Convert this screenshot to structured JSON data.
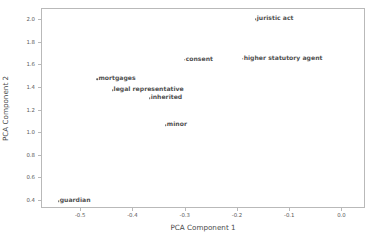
{
  "chart_data": {
    "type": "scatter",
    "title": "",
    "xlabel": "PCA Component 1",
    "ylabel": "PCA Component 2",
    "xlim": [
      -0.575,
      0.045
    ],
    "ylim": [
      0.33,
      2.1
    ],
    "grid": false,
    "legend": null,
    "marker_color": "#5a5a5a",
    "frame_color": "#b9b9b9",
    "xticks": [
      -0.5,
      -0.4,
      -0.3,
      -0.2,
      -0.1,
      0.0
    ],
    "xtick_labels": [
      "-0.5",
      "-0.4",
      "-0.3",
      "-0.2",
      "-0.1",
      "0.0"
    ],
    "yticks": [
      0.4,
      0.6,
      0.8,
      1.0,
      1.2,
      1.4,
      1.6,
      1.8,
      2.0
    ],
    "ytick_labels": [
      "0.4",
      "0.6",
      "0.8",
      "1.0",
      "1.2",
      "1.4",
      "1.6",
      "1.8",
      "2.0"
    ],
    "points": [
      {
        "label": "juristic act",
        "x": -0.166,
        "y": 2.01
      },
      {
        "label": "higher statutory agent",
        "x": -0.191,
        "y": 1.66
      },
      {
        "label": "consent",
        "x": -0.302,
        "y": 1.65
      },
      {
        "label": "mortgages",
        "x": -0.469,
        "y": 1.48
      },
      {
        "label": "legal representative",
        "x": -0.44,
        "y": 1.38
      },
      {
        "label": "inherited",
        "x": -0.369,
        "y": 1.31
      },
      {
        "label": "minor",
        "x": -0.338,
        "y": 1.07
      },
      {
        "label": "guardian",
        "x": -0.543,
        "y": 0.4
      }
    ]
  }
}
